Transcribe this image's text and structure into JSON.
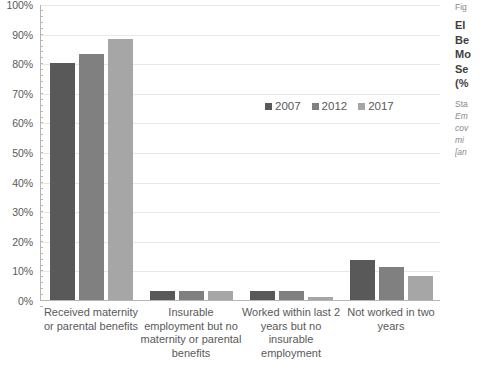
{
  "chart_data": {
    "type": "bar",
    "title": "",
    "xlabel": "",
    "ylabel": "",
    "ylim": [
      0,
      100
    ],
    "ytick_labels": [
      "100%",
      "90%",
      "80%",
      "70%",
      "60%",
      "50%",
      "40%",
      "30%",
      "20%",
      "10%",
      "0%"
    ],
    "ytick_values": [
      100,
      90,
      80,
      70,
      60,
      50,
      40,
      30,
      20,
      10,
      0
    ],
    "grid": true,
    "legend_position": "inside-upper-right",
    "categories": [
      "Received maternity or parental benefits",
      "Insurable employment but no maternity or parental benefits",
      "Worked within last 2 years but no insurable employment",
      "Not worked in two years"
    ],
    "series": [
      {
        "name": "2007",
        "color": "#595959",
        "values": [
          80,
          3,
          3,
          13.5
        ]
      },
      {
        "name": "2012",
        "color": "#808080",
        "values": [
          83,
          3,
          3,
          11.3
        ]
      },
      {
        "name": "2017",
        "color": "#a6a6a6",
        "values": [
          88.3,
          3,
          1,
          8.2
        ]
      }
    ]
  },
  "chart": {
    "y_axis": {
      "ticks": [
        {
          "label": "100%",
          "value": 100
        },
        {
          "label": "90%",
          "value": 90
        },
        {
          "label": "80%",
          "value": 80
        },
        {
          "label": "70%",
          "value": 70
        },
        {
          "label": "60%",
          "value": 60
        },
        {
          "label": "50%",
          "value": 50
        },
        {
          "label": "40%",
          "value": 40
        },
        {
          "label": "30%",
          "value": 30
        },
        {
          "label": "20%",
          "value": 20
        },
        {
          "label": "10%",
          "value": 10
        },
        {
          "label": "0%",
          "value": 0
        }
      ]
    },
    "legend": [
      {
        "label": "2007",
        "color": "#595959"
      },
      {
        "label": "2012",
        "color": "#808080"
      },
      {
        "label": "2017",
        "color": "#a6a6a6"
      }
    ],
    "x_axis": {
      "categories": [
        {
          "lines": [
            "Received maternity",
            "or parental benefits"
          ]
        },
        {
          "lines": [
            "Insurable",
            "employment but no",
            "maternity or parental",
            "benefits"
          ]
        },
        {
          "lines": [
            "Worked within last 2",
            "years but no",
            "insurable",
            "employment"
          ]
        },
        {
          "lines": [
            "Not worked in two",
            "years"
          ]
        }
      ]
    }
  },
  "caption": {
    "figure_number": "Fig",
    "title_lines": [
      "EI",
      "Be",
      "Mo",
      "Se",
      "(%"
    ],
    "source_lines": [
      "Sta",
      "Em",
      "cov",
      "mi",
      "[an"
    ]
  }
}
